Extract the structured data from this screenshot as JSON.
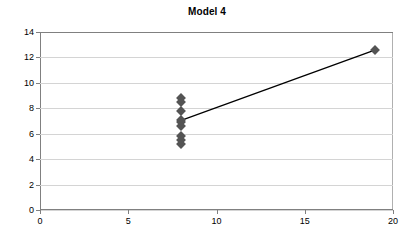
{
  "chart_data": {
    "type": "scatter",
    "title": "Model 4",
    "xlabel": "",
    "ylabel": "",
    "xlim": [
      0,
      20
    ],
    "ylim": [
      0,
      14
    ],
    "xticks": [
      0,
      5,
      10,
      15,
      20
    ],
    "yticks": [
      0,
      2,
      4,
      6,
      8,
      10,
      12,
      14
    ],
    "grid": "horizontal",
    "legend": "none",
    "marker_color": "#545454",
    "line_color": "#000000",
    "grid_color": "#d4d4d4",
    "axis_color": "#808080",
    "series": [
      {
        "name": "observations",
        "marker": "diamond",
        "points": [
          {
            "x": 8,
            "y": 8.8
          },
          {
            "x": 8,
            "y": 8.5
          },
          {
            "x": 8,
            "y": 7.8
          },
          {
            "x": 8,
            "y": 7.1
          },
          {
            "x": 8,
            "y": 6.9
          },
          {
            "x": 8,
            "y": 6.6
          },
          {
            "x": 8,
            "y": 5.8
          },
          {
            "x": 8,
            "y": 5.5
          },
          {
            "x": 8,
            "y": 5.2
          },
          {
            "x": 19,
            "y": 12.6
          }
        ]
      },
      {
        "name": "fit-line",
        "type": "line",
        "points": [
          {
            "x": 8,
            "y": 7.05
          },
          {
            "x": 19,
            "y": 12.6
          }
        ]
      }
    ]
  }
}
